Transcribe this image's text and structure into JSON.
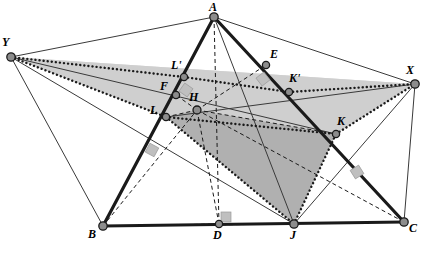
{
  "figure": {
    "kind": "geometry-diagram",
    "width": 424,
    "height": 255,
    "background_color": "#ffffff"
  },
  "colors": {
    "stroke_dark": "#1a1a1a",
    "stroke_thin": "#3a3a3a",
    "node_fill": "#8c8c8c",
    "node_stroke": "#1a1a1a",
    "shade_light": "#d9d9d9",
    "shade_mid": "#c9c9c9",
    "shade_dark": "#b0b0b0",
    "right_angle_fill": "#bfbfbf",
    "label_color": "#000000"
  },
  "points": [
    {
      "id": "A",
      "label": "A",
      "x": 214,
      "y": 17,
      "label_x": 209,
      "label_y": 1,
      "radius": 4.2
    },
    {
      "id": "Y",
      "label": "Y",
      "x": 11,
      "y": 57,
      "label_x": 2,
      "label_y": 36,
      "radius": 4.2
    },
    {
      "id": "X",
      "label": "X",
      "x": 415,
      "y": 84,
      "label_x": 406,
      "label_y": 64,
      "radius": 4.2
    },
    {
      "id": "E",
      "label": "E",
      "x": 266,
      "y": 65,
      "label_x": 270,
      "label_y": 48,
      "radius": 3.6
    },
    {
      "id": "Lp",
      "label": "L'",
      "x": 184,
      "y": 77,
      "label_x": 171,
      "label_y": 59,
      "radius": 3.6
    },
    {
      "id": "Kp",
      "label": "K'",
      "x": 289,
      "y": 92,
      "label_x": 289,
      "label_y": 72,
      "radius": 3.6
    },
    {
      "id": "F",
      "label": "F",
      "x": 176,
      "y": 95,
      "label_x": 160,
      "label_y": 80,
      "radius": 3.6
    },
    {
      "id": "H",
      "label": "H",
      "x": 197,
      "y": 110,
      "label_x": 189,
      "label_y": 91,
      "radius": 4.0
    },
    {
      "id": "L",
      "label": "L",
      "x": 166,
      "y": 117,
      "label_x": 150,
      "label_y": 104,
      "radius": 3.6
    },
    {
      "id": "K",
      "label": "K",
      "x": 336,
      "y": 134,
      "label_x": 337,
      "label_y": 115,
      "radius": 3.6
    },
    {
      "id": "B",
      "label": "B",
      "x": 103,
      "y": 226,
      "label_x": 88,
      "label_y": 228,
      "radius": 4.2
    },
    {
      "id": "D",
      "label": "D",
      "x": 219,
      "y": 224,
      "label_x": 213,
      "label_y": 229,
      "radius": 3.6
    },
    {
      "id": "J",
      "label": "J",
      "x": 294,
      "y": 224,
      "label_x": 290,
      "label_y": 229,
      "radius": 4.2
    },
    {
      "id": "C",
      "label": "C",
      "x": 404,
      "y": 222,
      "label_x": 409,
      "label_y": 222,
      "radius": 4.2
    }
  ],
  "faces": [
    {
      "name": "upper-plane-quad",
      "vertices": [
        "Y",
        "Lp",
        "Kp",
        "X"
      ],
      "fill": "#d9d9d9",
      "note": "light upper plane Y-L'-K'-X"
    },
    {
      "name": "mid-plane-quad",
      "vertices": [
        "Y",
        "L",
        "K",
        "X"
      ],
      "fill": "#cfcfcf",
      "note": "mid plane Y-L-K-X"
    },
    {
      "name": "inner-dark-quad",
      "vertices": [
        "L",
        "H",
        "K",
        "J"
      ],
      "fill": "#b0b0b0",
      "note": "dark inner quad L-H-K-J"
    }
  ],
  "thick_edges": [
    {
      "name": "edge-A-B",
      "from": "A",
      "to": "B"
    },
    {
      "name": "edge-A-C",
      "from": "A",
      "to": "C"
    },
    {
      "name": "edge-B-C",
      "from": "B",
      "to": "C"
    }
  ],
  "thin_edges": [
    {
      "name": "edge-Y-A",
      "from": "Y",
      "to": "A"
    },
    {
      "name": "edge-A-X",
      "from": "A",
      "to": "X"
    },
    {
      "name": "edge-Y-B",
      "from": "Y",
      "to": "B"
    },
    {
      "name": "edge-Y-J",
      "from": "Y",
      "to": "J"
    },
    {
      "name": "edge-X-C",
      "from": "X",
      "to": "C"
    },
    {
      "name": "edge-X-J",
      "from": "X",
      "to": "J"
    },
    {
      "name": "edge-A-J",
      "from": "A",
      "to": "J"
    },
    {
      "name": "edge-Y-K",
      "from": "Y",
      "to": "K"
    },
    {
      "name": "edge-X-L",
      "from": "X",
      "to": "L"
    }
  ],
  "dotted_edges": [
    {
      "name": "dotted-Y-Lp",
      "from": "Y",
      "to": "Lp"
    },
    {
      "name": "dotted-Lp-Kp",
      "from": "Lp",
      "to": "Kp"
    },
    {
      "name": "dotted-Kp-X",
      "from": "Kp",
      "to": "X"
    },
    {
      "name": "dotted-Y-L",
      "from": "Y",
      "to": "L"
    },
    {
      "name": "dotted-L-K",
      "from": "L",
      "to": "K"
    },
    {
      "name": "dotted-K-X",
      "from": "K",
      "to": "X"
    },
    {
      "name": "dotted-L-J",
      "from": "L",
      "to": "J"
    },
    {
      "name": "dotted-J-K",
      "from": "J",
      "to": "K"
    }
  ],
  "dashed_edges": [
    {
      "name": "dashed-A-D",
      "from": "A",
      "to": "D"
    },
    {
      "name": "dashed-B-D",
      "from": "B",
      "to": "D"
    },
    {
      "name": "dashed-D-H",
      "from": "D",
      "to": "H"
    },
    {
      "name": "dashed-B-H",
      "from": "B",
      "to": "H"
    },
    {
      "name": "dashed-H-C",
      "from": "H",
      "to": "C"
    },
    {
      "name": "dashed-H-F",
      "from": "H",
      "to": "F"
    },
    {
      "name": "dashed-H-E",
      "from": "H",
      "to": "E"
    },
    {
      "name": "dashed-H-K",
      "from": "H",
      "to": "K"
    },
    {
      "name": "dashed-H-L",
      "from": "H",
      "to": "L"
    },
    {
      "name": "dashed-B-J",
      "from": "B",
      "to": "J"
    }
  ],
  "right_angle_marks": [
    {
      "name": "right-angle-at-F",
      "x": 186,
      "y": 90,
      "rotation": 35
    },
    {
      "name": "right-angle-at-E",
      "x": 263,
      "y": 79,
      "rotation": -38
    },
    {
      "name": "right-angle-on-AB",
      "x": 152,
      "y": 150,
      "rotation": 28
    },
    {
      "name": "right-angle-on-AC",
      "x": 357,
      "y": 172,
      "rotation": -32
    },
    {
      "name": "right-angle-at-D",
      "x": 226,
      "y": 217,
      "rotation": 0
    }
  ],
  "labels_note": "Vertex letters drawn in italic serif: A, B, C, D, E, F, H, J, K, K', L, L', X, Y"
}
